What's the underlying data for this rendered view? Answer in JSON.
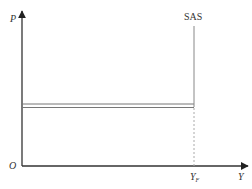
{
  "diagram": {
    "type": "economics-supply-curve",
    "axes": {
      "y_label": "P",
      "x_label": "Y",
      "origin_label": "O"
    },
    "curves": [
      {
        "name": "SAS",
        "label": "SAS",
        "kind": "vertical",
        "at_x_label": "Y",
        "at_x_subscript": "F"
      }
    ],
    "horizontal_line": {
      "kind": "double-line",
      "description": "horizontal price level line from P-axis to SAS"
    },
    "x_markers": [
      {
        "label": "Y",
        "subscript": "F",
        "style": "dashed-drop-line"
      }
    ],
    "colors": {
      "axis": "#333333",
      "curve": "#777777",
      "dashed": "#aaaaaa"
    }
  }
}
